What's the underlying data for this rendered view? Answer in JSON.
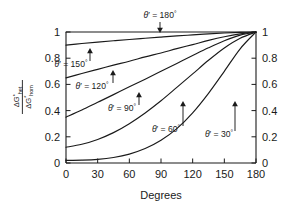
{
  "chart_data": {
    "type": "line",
    "title": "",
    "xlabel": "Degrees",
    "ylabel": "ΔG*het / ΔG*hom",
    "xlim": [
      0,
      180
    ],
    "ylim": [
      0,
      1
    ],
    "grid": false,
    "legend_position": "inline-annotations",
    "x_ticks": [
      "0",
      "30",
      "60",
      "90",
      "120",
      "150",
      "180"
    ],
    "x_tick_values": [
      0,
      30,
      60,
      90,
      120,
      150,
      180
    ],
    "y_ticks": [
      "0",
      "0.2",
      "0.4",
      "0.6",
      "0.8",
      "1"
    ],
    "y_tick_values": [
      0,
      0.2,
      0.4,
      0.6,
      0.8,
      1
    ],
    "right_axis_ticks": [
      "0",
      "0.2",
      "0.4",
      "0.6",
      "0.8",
      "1"
    ],
    "series": [
      {
        "name": "θ' = 180°",
        "theta": 180,
        "x": [
          0,
          15,
          30,
          45,
          60,
          75,
          90,
          105,
          120,
          135,
          150,
          165,
          180
        ],
        "values": [
          1.0,
          1.0,
          1.0,
          1.0,
          1.0,
          1.0,
          1.0,
          1.0,
          1.0,
          1.0,
          1.0,
          1.0,
          1.0
        ]
      },
      {
        "name": "θ' = 150°",
        "theta": 150,
        "x": [
          0,
          15,
          30,
          45,
          60,
          75,
          90,
          105,
          120,
          135,
          150,
          165,
          180
        ],
        "values": [
          0.9,
          0.912,
          0.923,
          0.933,
          0.943,
          0.952,
          0.961,
          0.97,
          0.978,
          0.986,
          0.992,
          0.997,
          1.0
        ]
      },
      {
        "name": "θ' = 120°",
        "theta": 120,
        "x": [
          0,
          15,
          30,
          45,
          60,
          75,
          90,
          105,
          120,
          135,
          150,
          165,
          180
        ],
        "values": [
          0.65,
          0.683,
          0.715,
          0.747,
          0.777,
          0.81,
          0.84,
          0.873,
          0.904,
          0.936,
          0.964,
          0.986,
          1.0
        ]
      },
      {
        "name": "θ' = 90°",
        "theta": 90,
        "x": [
          0,
          15,
          30,
          45,
          60,
          75,
          90,
          105,
          120,
          135,
          150,
          165,
          180
        ],
        "values": [
          0.35,
          0.404,
          0.463,
          0.522,
          0.582,
          0.64,
          0.7,
          0.76,
          0.82,
          0.879,
          0.933,
          0.976,
          1.0
        ]
      },
      {
        "name": "θ' = 60°",
        "theta": 60,
        "x": [
          0,
          15,
          30,
          45,
          60,
          75,
          90,
          105,
          120,
          135,
          150,
          165,
          180
        ],
        "values": [
          0.12,
          0.143,
          0.18,
          0.232,
          0.3,
          0.382,
          0.475,
          0.577,
          0.68,
          0.784,
          0.878,
          0.952,
          1.0
        ]
      },
      {
        "name": "θ' = 30°",
        "theta": 30,
        "x": [
          0,
          15,
          30,
          45,
          60,
          75,
          90,
          105,
          120,
          135,
          150,
          165,
          180
        ],
        "values": [
          0.02,
          0.022,
          0.028,
          0.042,
          0.068,
          0.11,
          0.173,
          0.262,
          0.383,
          0.532,
          0.7,
          0.872,
          1.0
        ]
      }
    ],
    "annotations": [
      {
        "label": "θ' = 180°",
        "theta_text": "θ",
        "prime": "′",
        "eq_text": " = 180",
        "deg": "°",
        "arrow": "down",
        "label_x": 160,
        "label_y": 18,
        "arrow_x": 160,
        "arrow_y0": 22,
        "arrow_y1": 33
      },
      {
        "label": "θ' = 150°",
        "theta_text": "θ",
        "prime": "′",
        "eq_text": " = 150",
        "deg": "°",
        "arrow": "up",
        "label_x": 71,
        "label_y": 67,
        "arrow_x": 90,
        "arrow_y0": 61,
        "arrow_y1": 48
      },
      {
        "label": "θ' = 120°",
        "theta_text": "θ",
        "prime": "′",
        "eq_text": " = 120",
        "deg": "°",
        "arrow": "up",
        "label_x": 92,
        "label_y": 89,
        "arrow_x": 113,
        "arrow_y0": 83,
        "arrow_y1": 70
      },
      {
        "label": "θ' = 90°",
        "theta_text": "θ",
        "prime": "′",
        "eq_text": " = 90",
        "deg": "°",
        "arrow": "up",
        "label_x": 122,
        "label_y": 111,
        "arrow_x": 139,
        "arrow_y0": 105,
        "arrow_y1": 92
      },
      {
        "label": "θ' = 60°",
        "theta_text": "θ",
        "prime": "′",
        "eq_text": " = 60",
        "deg": "°",
        "arrow": "up",
        "label_x": 166,
        "label_y": 132,
        "arrow_x": 183,
        "arrow_y0": 126,
        "arrow_y1": 101
      },
      {
        "label": "θ' = 30°",
        "theta_text": "θ",
        "prime": "′",
        "eq_text": " = 30",
        "deg": "°",
        "arrow": "up",
        "label_x": 219,
        "label_y": 137,
        "arrow_x": 235,
        "arrow_y0": 131,
        "arrow_y1": 101
      }
    ],
    "ylabel_parts": {
      "numerator_delta": "ΔG",
      "numerator_sup": "*",
      "numerator_sub": "het",
      "denominator_delta": "ΔG",
      "denominator_sup": "*",
      "denominator_sub": "hom"
    },
    "colors": {
      "line": "#1a1a1a",
      "axis": "#1a1a1a",
      "background": "#ffffff",
      "text": "#1a1a1a"
    }
  }
}
